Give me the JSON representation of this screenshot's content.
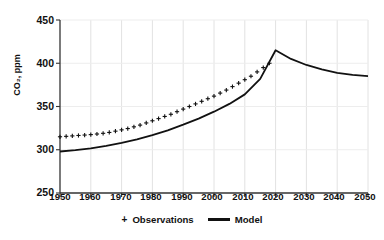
{
  "chart_data": {
    "type": "line",
    "title": "",
    "xlabel": "",
    "ylabel": "CO₂, ppm",
    "xlim": [
      1950,
      2050
    ],
    "ylim": [
      250,
      450
    ],
    "ytick_labels": [
      "450",
      "400",
      "350",
      "300",
      "250"
    ],
    "ytick_values": [
      450,
      400,
      350,
      300,
      250
    ],
    "xtick_labels": [
      "1950",
      "1960",
      "1970",
      "1980",
      "1990",
      "2000",
      "2010",
      "2020",
      "2030",
      "2040",
      "2050"
    ],
    "xtick_values": [
      1950,
      1960,
      1970,
      1980,
      1990,
      2000,
      2010,
      2020,
      2030,
      2040,
      2050
    ],
    "grid": true,
    "legend_position": "bottom",
    "series": [
      {
        "name": "Observations",
        "marker": "+",
        "color": "#111111",
        "x": [
          1950,
          1952,
          1954,
          1956,
          1958,
          1960,
          1962,
          1964,
          1966,
          1968,
          1970,
          1972,
          1974,
          1976,
          1978,
          1980,
          1982,
          1984,
          1986,
          1988,
          1990,
          1992,
          1994,
          1996,
          1998,
          2000,
          2002,
          2004,
          2006,
          2008,
          2010,
          2012,
          2014,
          2016,
          2018
        ],
        "values": [
          315,
          315.5,
          316,
          316.5,
          317,
          317.5,
          318.2,
          319,
          320,
          321.5,
          323,
          324.5,
          326.5,
          328.5,
          331,
          333.5,
          336,
          338.5,
          341,
          344,
          347,
          350,
          353,
          356,
          359,
          362,
          365.5,
          369,
          373,
          377,
          381,
          385,
          390,
          395,
          400
        ]
      },
      {
        "name": "Model",
        "marker": "line",
        "color": "#111111",
        "x": [
          1950,
          1955,
          1960,
          1965,
          1970,
          1975,
          1980,
          1985,
          1990,
          1995,
          2000,
          2005,
          2010,
          2015,
          2020,
          2025,
          2030,
          2035,
          2040,
          2045,
          2050
        ],
        "values": [
          298,
          299.5,
          301.5,
          304.5,
          308,
          312,
          317,
          322.5,
          329,
          336,
          344,
          353,
          364,
          382,
          415,
          405,
          398,
          393,
          389,
          386.5,
          385
        ]
      }
    ],
    "annotations": {
      "peak_year": 2020,
      "peak_value": 415
    }
  },
  "legend": {
    "observations_marker": "+",
    "observations_label": "Observations",
    "model_label": "Model"
  }
}
